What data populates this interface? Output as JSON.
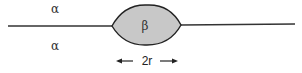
{
  "diagram": {
    "labels": {
      "alpha_top": "α",
      "alpha_bottom": "α",
      "beta": "β",
      "dimension": "2r"
    },
    "colors": {
      "line": "#333333",
      "lens_fill": "#c8c8c8",
      "lens_stroke": "#222222"
    }
  }
}
